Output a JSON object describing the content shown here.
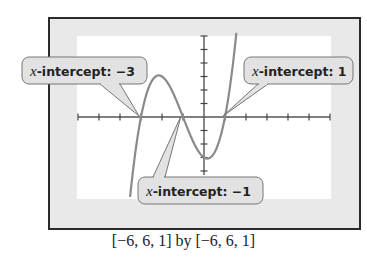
{
  "chart_data": {
    "type": "line",
    "title": "",
    "function": "f(x) = (x + 3)(x + 1)(x - 1)",
    "xlabel": "",
    "ylabel": "",
    "xlim": [
      -6,
      6
    ],
    "ylim": [
      -6,
      6
    ],
    "xscl": 1,
    "yscl": 1,
    "grid": false,
    "series": [
      {
        "name": "cubic",
        "x": [
          -3.6,
          -3.4,
          -3.2,
          -3.0,
          -2.8,
          -2.6,
          -2.4,
          -2.2,
          -2.0,
          -1.8,
          -1.6,
          -1.4,
          -1.2,
          -1.0,
          -0.8,
          -0.6,
          -0.4,
          -0.2,
          0.0,
          0.2,
          0.4,
          0.6,
          0.8,
          1.0,
          1.2,
          1.4,
          1.6,
          1.8
        ],
        "y": [
          -5.98,
          -3.5,
          -1.57,
          0,
          1.2,
          2.02,
          2.52,
          2.74,
          3.0,
          2.58,
          2.3,
          1.94,
          0.97,
          0,
          -1.13,
          -1.97,
          -2.69,
          -3.1,
          -3.0,
          -2.95,
          -2.66,
          -1.68,
          -1.19,
          0,
          1.06,
          3.19,
          5.34,
          7.64
        ]
      }
    ],
    "annotations": [
      {
        "label_var": "x",
        "label_text": "-intercept: −3",
        "x": -3,
        "y": 0
      },
      {
        "label_var": "x",
        "label_text": "-intercept: 1",
        "x": 1,
        "y": 0
      },
      {
        "label_var": "x",
        "label_text": "-intercept: −1",
        "x": -1,
        "y": 0
      }
    ],
    "window_caption": "[−6, 6, 1] by [−6, 6, 1]"
  }
}
